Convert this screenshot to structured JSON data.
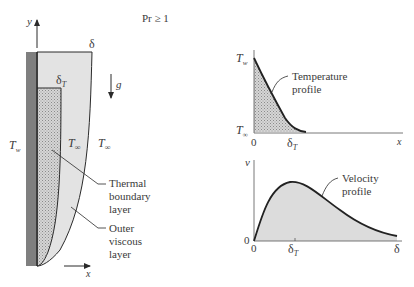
{
  "title": "Pr ≥ 1",
  "colors": {
    "wall": "#7f7f7f",
    "wall_edge": "#222222",
    "outer_layer_fill": "#e3e3e3",
    "thermal_layer_fill": "#cfcfcf",
    "line": "#2a2a2a",
    "text": "#3a3a3a"
  },
  "plate": {
    "y_axis_label": "y",
    "x_axis_label": "x",
    "delta_label": "δ",
    "delta_t_label": "δ",
    "delta_t_sub": "T",
    "gravity_label": "g",
    "t_wall": "T",
    "t_wall_sub": "w",
    "t_inf_inner": "T",
    "t_inf_inner_sub": "∞",
    "t_inf_outer": "T",
    "t_inf_outer_sub": "∞",
    "callout_thermal": [
      "Thermal",
      "boundary",
      "layer"
    ],
    "callout_outer": [
      "Outer",
      "viscous",
      "layer"
    ]
  },
  "temperature_plot": {
    "y_top_label": "T",
    "y_top_sub": "w",
    "y_bottom_label": "T",
    "y_bottom_sub": "∞",
    "x_origin": "0",
    "x_delta_t": "δ",
    "x_delta_t_sub": "T",
    "x_axis_label": "x",
    "callout": [
      "Temperature",
      "profile"
    ]
  },
  "velocity_plot": {
    "y_label": "v",
    "y_zero": "0",
    "x_origin": "0",
    "x_delta_t": "δ",
    "x_delta_t_sub": "T",
    "x_delta": "δ",
    "callout": [
      "Velocity",
      "profile"
    ]
  }
}
